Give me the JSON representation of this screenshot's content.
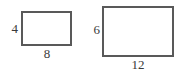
{
  "figure": {
    "type": "geometry-diagram",
    "background_color": "#ffffff",
    "stroke_color": "#595959",
    "label_color": "#3a3a3a",
    "shapes": [
      {
        "id": "small-rectangle",
        "kind": "rectangle",
        "height_label": "4",
        "width_label": "8",
        "height_value": 4,
        "width_value": 8
      },
      {
        "id": "large-rectangle",
        "kind": "rectangle",
        "height_label": "6",
        "width_label": "12",
        "height_value": 6,
        "width_value": 12
      }
    ]
  }
}
